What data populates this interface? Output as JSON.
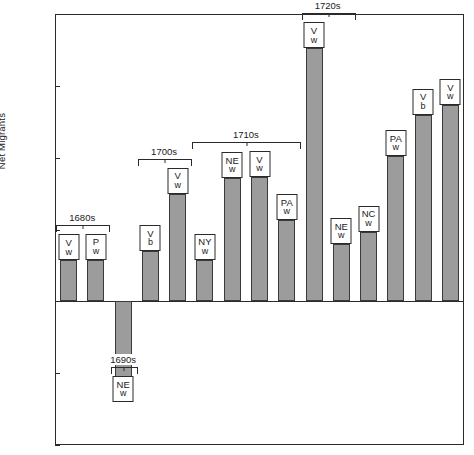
{
  "chart_data": {
    "type": "bar",
    "title": "",
    "xlabel": "",
    "ylabel": "Net Migrants",
    "ylim": [
      -20000,
      40000
    ],
    "grid": false,
    "legend": "none",
    "ytick_labels": [
      "40,000",
      "30,000",
      "20,000",
      "10,000",
      "0",
      "-10,000",
      "-20,000"
    ],
    "ytick_values": [
      40000,
      30000,
      20000,
      10000,
      0,
      -10000,
      -20000
    ],
    "decade_groups": [
      {
        "label": "1680s",
        "count": 2
      },
      {
        "label": "1690s",
        "count": 1
      },
      {
        "label": "1700s",
        "count": 2
      },
      {
        "label": "1710s",
        "count": 4
      },
      {
        "label": "1720s",
        "count": 2
      },
      {
        "label": "1730s",
        "count": 5
      }
    ],
    "categories": [
      "V w",
      "P w",
      "NE w",
      "V b",
      "V w",
      "NY w",
      "NE w",
      "V w",
      "PA w",
      "V w",
      "NE w",
      "NC w",
      "PA w",
      "V b",
      "V w"
    ],
    "values": [
      5700,
      5800,
      -14000,
      7000,
      15000,
      5800,
      17200,
      17300,
      11300,
      35200,
      8000,
      9700,
      20200,
      26000,
      27300
    ],
    "bars": [
      {
        "colony": "V",
        "race": "w",
        "value": 5700,
        "decade": "1680s"
      },
      {
        "colony": "P",
        "race": "w",
        "value": 5800,
        "decade": "1680s"
      },
      {
        "colony": "NE",
        "race": "w",
        "value": -14000,
        "decade": "1690s"
      },
      {
        "colony": "V",
        "race": "b",
        "value": 7000,
        "decade": "1700s"
      },
      {
        "colony": "V",
        "race": "w",
        "value": 15000,
        "decade": "1700s"
      },
      {
        "colony": "NY",
        "race": "w",
        "value": 5800,
        "decade": "1710s"
      },
      {
        "colony": "NE",
        "race": "w",
        "value": 17200,
        "decade": "1710s"
      },
      {
        "colony": "V",
        "race": "w",
        "value": 17300,
        "decade": "1710s"
      },
      {
        "colony": "PA",
        "race": "w",
        "value": 11300,
        "decade": "1710s"
      },
      {
        "colony": "V",
        "race": "w",
        "value": 35200,
        "decade": "1720s"
      },
      {
        "colony": "NE",
        "race": "w",
        "value": 8000,
        "decade": "1720s"
      },
      {
        "colony": "NC",
        "race": "w",
        "value": 9700,
        "decade": "1730s"
      },
      {
        "colony": "PA",
        "race": "w",
        "value": 20200,
        "decade": "1730s"
      },
      {
        "colony": "V",
        "race": "b",
        "value": 26000,
        "decade": "1730s"
      },
      {
        "colony": "V",
        "race": "w",
        "value": 27300,
        "decade": "1730s"
      }
    ],
    "colors": {
      "bar_fill": "#9c9c9c",
      "bar_stroke": "#3a3a3a",
      "axis": "#2a2a2a",
      "background": "#ffffff"
    }
  }
}
